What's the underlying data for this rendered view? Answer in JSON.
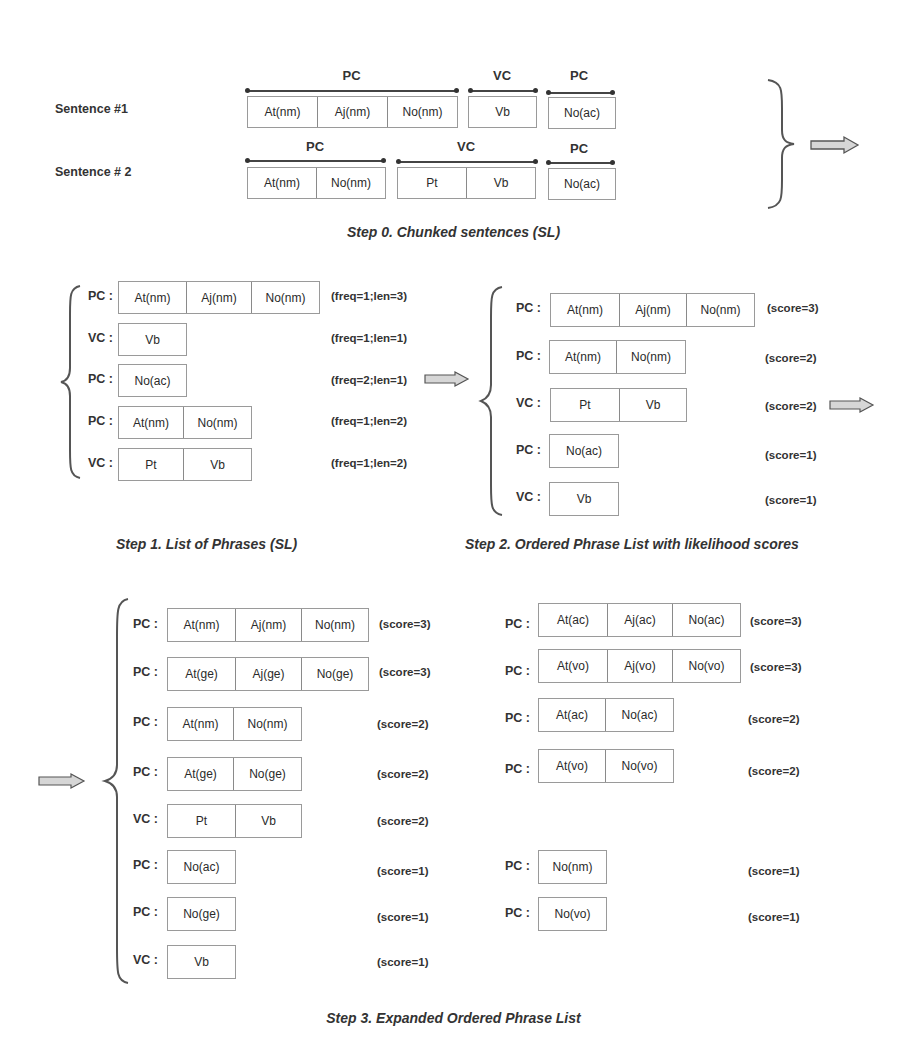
{
  "step0": {
    "caption": "Step 0. Chunked sentences (SL)",
    "sentences": [
      {
        "label": "Sentence #1",
        "chunks": [
          {
            "type": "PC",
            "tokens": [
              "At(nm)",
              "Aj(nm)",
              "No(nm)"
            ]
          },
          {
            "type": "VC",
            "tokens": [
              "Vb"
            ]
          },
          {
            "type": "PC",
            "tokens": [
              "No(ac)"
            ]
          }
        ]
      },
      {
        "label": "Sentence # 2",
        "chunks": [
          {
            "type": "PC",
            "tokens": [
              "At(nm)",
              "No(nm)"
            ]
          },
          {
            "type": "VC",
            "tokens": [
              "Pt",
              "Vb"
            ]
          },
          {
            "type": "PC",
            "tokens": [
              "No(ac)"
            ]
          }
        ]
      }
    ]
  },
  "step1": {
    "caption": "Step 1. List of Phrases (SL)",
    "rows": [
      {
        "label": "PC :",
        "tokens": [
          "At(nm)",
          "Aj(nm)",
          "No(nm)"
        ],
        "meta": "(freq=1;len=3)"
      },
      {
        "label": "VC :",
        "tokens": [
          "Vb"
        ],
        "meta": "(freq=1;len=1)"
      },
      {
        "label": "PC :",
        "tokens": [
          "No(ac)"
        ],
        "meta": "(freq=2;len=1)"
      },
      {
        "label": "PC :",
        "tokens": [
          "At(nm)",
          "No(nm)"
        ],
        "meta": "(freq=1;len=2)"
      },
      {
        "label": "VC :",
        "tokens": [
          "Pt",
          "Vb"
        ],
        "meta": "(freq=1;len=2)"
      }
    ]
  },
  "step2": {
    "caption": "Step 2. Ordered Phrase List with likelihood scores",
    "rows": [
      {
        "label": "PC :",
        "tokens": [
          "At(nm)",
          "Aj(nm)",
          "No(nm)"
        ],
        "meta": "(score=3)"
      },
      {
        "label": "PC :",
        "tokens": [
          "At(nm)",
          "No(nm)"
        ],
        "meta": "(score=2)"
      },
      {
        "label": "VC :",
        "tokens": [
          "Pt",
          "Vb"
        ],
        "meta": "(score=2)"
      },
      {
        "label": "PC :",
        "tokens": [
          "No(ac)"
        ],
        "meta": "(score=1)"
      },
      {
        "label": "VC :",
        "tokens": [
          "Vb"
        ],
        "meta": "(score=1)"
      }
    ]
  },
  "step3": {
    "caption": "Step 3. Expanded Ordered Phrase List",
    "left_rows": [
      {
        "label": "PC :",
        "tokens": [
          "At(nm)",
          "Aj(nm)",
          "No(nm)"
        ],
        "meta": "(score=3)"
      },
      {
        "label": "PC :",
        "tokens": [
          "At(ge)",
          "Aj(ge)",
          "No(ge)"
        ],
        "meta": "(score=3)"
      },
      {
        "label": "PC :",
        "tokens": [
          "At(nm)",
          "No(nm)"
        ],
        "meta": "(score=2)"
      },
      {
        "label": "PC :",
        "tokens": [
          "At(ge)",
          "No(ge)"
        ],
        "meta": "(score=2)"
      },
      {
        "label": "VC :",
        "tokens": [
          "Pt",
          "Vb"
        ],
        "meta": "(score=2)"
      },
      {
        "label": "PC :",
        "tokens": [
          "No(ac)"
        ],
        "meta": "(score=1)"
      },
      {
        "label": "PC :",
        "tokens": [
          "No(ge)"
        ],
        "meta": "(score=1)"
      },
      {
        "label": "VC :",
        "tokens": [
          "Vb"
        ],
        "meta": "(score=1)"
      }
    ],
    "right_rows": [
      {
        "label": "PC :",
        "tokens": [
          "At(ac)",
          "Aj(ac)",
          "No(ac)"
        ],
        "meta": "(score=3)"
      },
      {
        "label": "PC :",
        "tokens": [
          "At(vo)",
          "Aj(vo)",
          "No(vo)"
        ],
        "meta": "(score=3)"
      },
      {
        "label": "PC :",
        "tokens": [
          "At(ac)",
          "No(ac)"
        ],
        "meta": "(score=2)"
      },
      {
        "label": "PC :",
        "tokens": [
          "At(vo)",
          "No(vo)"
        ],
        "meta": "(score=2)"
      },
      {
        "label": "PC :",
        "tokens": [
          "No(nm)"
        ],
        "meta": "(score=1)"
      },
      {
        "label": "PC :",
        "tokens": [
          "No(vo)"
        ],
        "meta": "(score=1)"
      }
    ]
  },
  "icons": {
    "arrow": "block-right-arrow",
    "brace": "curly-brace"
  },
  "colors": {
    "ink": "#2a2a2a",
    "box_border": "#9a9a9a",
    "arrow_fill": "#d6d6d6",
    "arrow_stroke": "#555555"
  }
}
